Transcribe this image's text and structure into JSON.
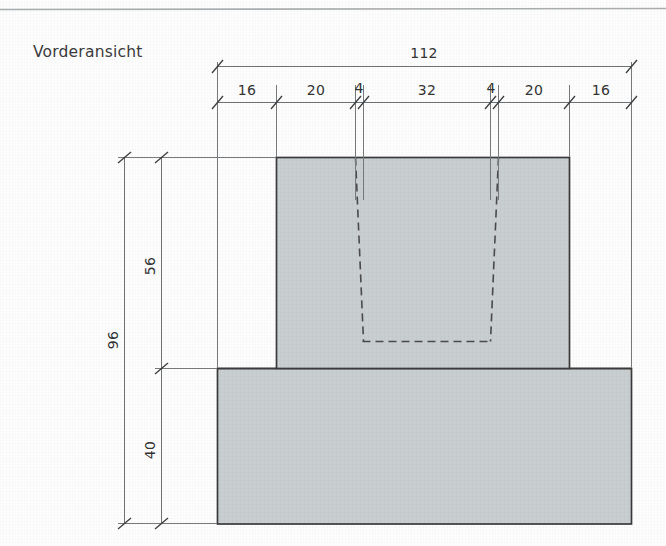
{
  "sheet": {
    "title": "Vorderansicht",
    "background_color": "#fdfdfd",
    "rule_color": "#8a8e90",
    "outline_color": "#3a3a3a",
    "hatch_fill_color": "#c9ced0",
    "dimension_line_color": "#6e7274",
    "hidden_line_color": "#4a4a4a",
    "text_color": "#333333"
  },
  "drawing": {
    "view_name": "Vorderansicht",
    "units_note": "",
    "overall_width": "112",
    "overall_height": "96"
  },
  "dimensions": {
    "horizontal_overall": {
      "value": "112"
    },
    "horizontal_chain": [
      {
        "value": "16"
      },
      {
        "value": "20"
      },
      {
        "value": "4"
      },
      {
        "value": "32"
      },
      {
        "value": "4"
      },
      {
        "value": "20"
      },
      {
        "value": "16"
      }
    ],
    "vertical_overall": {
      "value": "96"
    },
    "vertical_chain": [
      {
        "value": "56"
      },
      {
        "value": "40"
      }
    ]
  },
  "geometry": {
    "base_block": {
      "label": "base-block",
      "width": "112",
      "height": "40"
    },
    "upper_block": {
      "label": "upper-block",
      "width": "80",
      "height": "56"
    },
    "hidden_slot": {
      "label": "hidden-slot",
      "top_width": "40",
      "bottom_width": "32",
      "depth": "46"
    }
  }
}
